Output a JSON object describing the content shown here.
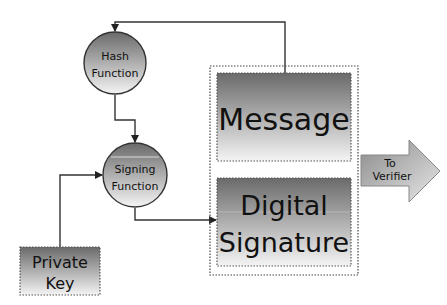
{
  "diagram": {
    "title": "",
    "nodes": {
      "hash_function": {
        "line1": "Hash",
        "line2": "Function",
        "shape": "circle"
      },
      "signing_function": {
        "line1": "Signing",
        "line2": "Function",
        "shape": "circle"
      },
      "private_key": {
        "line1": "Private",
        "line2": "Key",
        "shape": "rectangle"
      },
      "message": {
        "label": "Message",
        "shape": "rectangle"
      },
      "digital_signature": {
        "line1": "Digital",
        "line2": "Signature",
        "shape": "rectangle"
      },
      "to_verifier": {
        "line1": "To",
        "line2": "Verifier",
        "shape": "block-arrow"
      }
    },
    "edges": [
      {
        "from": "message",
        "to": "hash_function"
      },
      {
        "from": "hash_function",
        "to": "signing_function"
      },
      {
        "from": "private_key",
        "to": "signing_function"
      },
      {
        "from": "signing_function",
        "to": "digital_signature"
      }
    ],
    "colors": {
      "gradient_dark": "#6e6e6e",
      "gradient_light": "#f2f2f2",
      "line": "#222222"
    }
  }
}
